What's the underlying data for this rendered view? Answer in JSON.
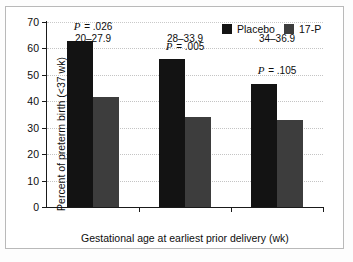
{
  "chart_data": {
    "type": "bar",
    "title": "",
    "subtitle": "",
    "xlabel": "Gestational age at earliest prior delivery (wk)",
    "ylabel": "Percent of preterm birth (<37 wk)",
    "categories": [
      "20–27.9",
      "28–33.9",
      "34–36.9"
    ],
    "series": [
      {
        "name": "Placebo",
        "color": "#131313",
        "values": [
          63.0,
          56.0,
          46.5
        ]
      },
      {
        "name": "17-P",
        "color": "#3d3d3d",
        "values": [
          41.5,
          34.2,
          33.0
        ]
      }
    ],
    "ylim": [
      0,
      70
    ],
    "yticks": [
      0,
      10,
      20,
      30,
      40,
      50,
      60,
      70
    ],
    "ytick_labels": [
      "0",
      "10",
      "20",
      "30",
      "40",
      "50",
      "60",
      "70"
    ],
    "grid": true,
    "grid_axis": "y",
    "grid_style": "dotted",
    "legend_position": "top-right",
    "annotations": [
      {
        "label_prefix": "P",
        "label_rest": "= .026",
        "category_index": 0,
        "value": 68.5
      },
      {
        "label_prefix": "P",
        "label_rest": "= .005",
        "category_index": 1,
        "value": 61.0
      },
      {
        "label_prefix": "P",
        "label_rest": "= .105",
        "category_index": 2,
        "value": 52.0
      }
    ]
  }
}
